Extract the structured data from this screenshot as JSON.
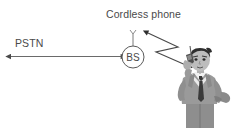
{
  "diagram": {
    "type": "network-topology-illustration",
    "background_color": "#ffffff",
    "title": "Cordless phone",
    "labels": {
      "title": "Cordless phone",
      "pstn": "PSTN",
      "base_station": "BS"
    },
    "colors": {
      "line": "#4a4a4a",
      "text": "#4a4a4a",
      "suit": "#9a9a9a",
      "suit_dark": "#6f6f6f",
      "shirt": "#f2f2f2",
      "tie": "#3a3a3a",
      "hair": "#2e2e2e",
      "skin": "#b9b9b9",
      "trousers": "#8e8e8e"
    },
    "nodes": [
      {
        "name": "pstn-endpoint",
        "label": "PSTN",
        "shape": "arrow-end",
        "x": 10,
        "y": 56
      },
      {
        "name": "base-station",
        "label": "BS",
        "shape": "circle",
        "cx": 133,
        "cy": 57,
        "r": 11,
        "has_antenna": true
      },
      {
        "name": "cordless-phone-user",
        "label": "Cordless phone",
        "shape": "person-illustration",
        "x": 176,
        "y": 58,
        "width": 62,
        "height": 70
      }
    ],
    "links": [
      {
        "name": "pstn-link",
        "style": "solid-line",
        "from": "pstn-endpoint",
        "to": "base-station",
        "arrowheads": "both",
        "x1": 10,
        "y1": 56,
        "x2": 122,
        "y2": 56
      },
      {
        "name": "wireless-link",
        "style": "zigzag",
        "from": "base-station",
        "to": "cordless-phone-user",
        "arrowheads": "both",
        "points": "148,33 178,47 156,52 188,66"
      }
    ]
  }
}
